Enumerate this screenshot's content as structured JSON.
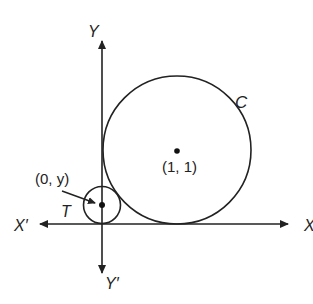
{
  "diagram": {
    "type": "coordinate-geometry",
    "axes": {
      "x_positive_label": "X",
      "x_negative_label": "X′",
      "y_positive_label": "Y",
      "y_negative_label": "Y′"
    },
    "circles": [
      {
        "id": "C",
        "label": "C",
        "center_label": "(1, 1)"
      },
      {
        "id": "T",
        "label": "T",
        "center_label": "(0, y)"
      }
    ],
    "colors": {
      "stroke": "#222222",
      "background": "#ffffff"
    }
  }
}
